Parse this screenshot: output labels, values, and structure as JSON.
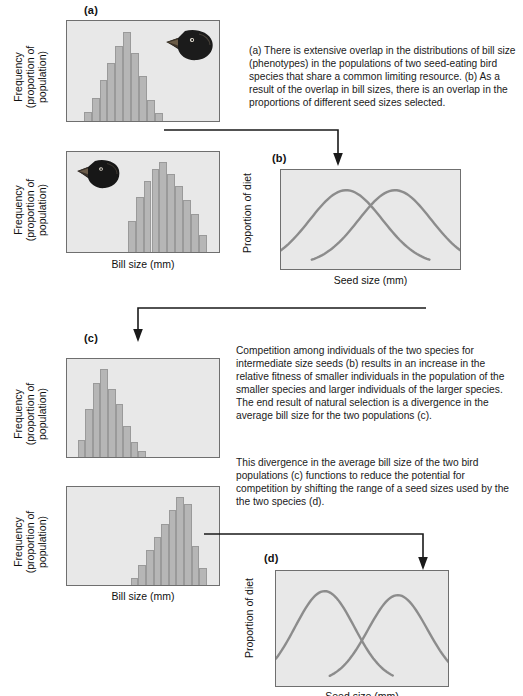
{
  "figure": {
    "bar_color": "#b6b6b6",
    "curve_color": "#8c8c8c",
    "panel_bg": "#e8e8e8",
    "panel_border": "#6f6f6f",
    "arrow_color": "#1a1a1a"
  },
  "panels": {
    "a": {
      "tag": "(a)",
      "ylabel_line1": "Frequency",
      "ylabel_line2": "(proportion of",
      "ylabel_line3": "population)",
      "xlabel": "Bill size (mm)",
      "bird_icon_top": "bird-head-icon",
      "bird_icon_bottom": "bird-head-icon"
    },
    "b": {
      "tag": "(b)",
      "ylabel": "Proportion of diet",
      "xlabel": "Seed size (mm)"
    },
    "c": {
      "tag": "(c)",
      "ylabel_line1": "Frequency",
      "ylabel_line2": "(proportion of",
      "ylabel_line3": "population)",
      "xlabel": "Bill size (mm)"
    },
    "d": {
      "tag": "(d)",
      "ylabel": "Proportion of diet",
      "xlabel": "Seed size (mm)"
    }
  },
  "captions": {
    "first": "(a) There is extensive overlap in the distributions of bill size (phenotypes) in the populations of two seed-eating bird species that share a common limiting resource. (b) As a result of the overlap in bill sizes, there is an overlap in the proportions of different seed sizes selected.",
    "second": "Competition among individuals of the two species for intermediate size seeds (b) results in an increase in the relative fitness of smaller individuals in the population of the smaller species and larger individuals of the larger species. The end result of natural selection is a divergence in the average bill size for the two populations (c).",
    "third": "This divergence in the average bill size of the two bird populations (c) functions to reduce the potential for competition by shifting the range of a seed sizes used by the the two species (d)."
  },
  "chart_data": [
    {
      "id": "a-top",
      "type": "bar",
      "title": "Species 1 bill size distribution (before displacement)",
      "xlabel": "Bill size (mm)",
      "ylabel": "Frequency (proportion of population)",
      "ylim": [
        0,
        100
      ],
      "grid": false,
      "categories": [
        "1",
        "2",
        "3",
        "4",
        "5",
        "6",
        "7",
        "8",
        "9",
        "10"
      ],
      "values": [
        10,
        24,
        44,
        62,
        80,
        95,
        72,
        48,
        22,
        8
      ],
      "bar_start_fraction": 0.11,
      "bar_width_fraction": 0.052
    },
    {
      "id": "a-bottom",
      "type": "bar",
      "title": "Species 2 bill size distribution (before displacement)",
      "xlabel": "Bill size (mm)",
      "ylabel": "Frequency (proportion of population)",
      "ylim": [
        0,
        100
      ],
      "grid": false,
      "categories": [
        "1",
        "2",
        "3",
        "4",
        "5",
        "6",
        "7",
        "8",
        "9",
        "10"
      ],
      "values": [
        33,
        58,
        76,
        88,
        96,
        83,
        70,
        55,
        40,
        18
      ],
      "bar_start_fraction": 0.4,
      "bar_width_fraction": 0.052
    },
    {
      "id": "b",
      "type": "line",
      "title": "Proportion of diet vs seed size (before displacement)",
      "xlabel": "Seed size (mm)",
      "ylabel": "Proportion of diet",
      "grid": false,
      "series": [
        {
          "name": "Species 1 diet",
          "peak_x": 0.36,
          "spread": 0.2,
          "peak_y": 0.88
        },
        {
          "name": "Species 2 diet",
          "peak_x": 0.63,
          "spread": 0.2,
          "peak_y": 0.88
        }
      ],
      "overlap": "extensive"
    },
    {
      "id": "c-top",
      "type": "bar",
      "title": "Species 1 bill size distribution (after displacement, smaller)",
      "xlabel": "Bill size (mm)",
      "ylabel": "Frequency (proportion of population)",
      "ylim": [
        0,
        100
      ],
      "grid": false,
      "categories": [
        "1",
        "2",
        "3",
        "4",
        "5",
        "6",
        "7",
        "8",
        "9"
      ],
      "values": [
        18,
        52,
        80,
        96,
        74,
        58,
        34,
        16,
        6
      ],
      "bar_start_fraction": 0.07,
      "bar_width_fraction": 0.05
    },
    {
      "id": "c-bottom",
      "type": "bar",
      "title": "Species 2 bill size distribution (after displacement, larger)",
      "xlabel": "Bill size (mm)",
      "ylabel": "Frequency (proportion of population)",
      "ylim": [
        0,
        100
      ],
      "grid": false,
      "categories": [
        "1",
        "2",
        "3",
        "4",
        "5",
        "6",
        "7",
        "8",
        "9"
      ],
      "values": [
        8,
        22,
        38,
        52,
        66,
        82,
        96,
        88,
        42,
        18
      ],
      "bar_start_fraction": 0.42,
      "bar_width_fraction": 0.05
    },
    {
      "id": "d",
      "type": "line",
      "title": "Proportion of diet vs seed size (after displacement)",
      "xlabel": "Seed size (mm)",
      "ylabel": "Proportion of diet",
      "grid": false,
      "series": [
        {
          "name": "Species 1 diet",
          "peak_x": 0.28,
          "spread": 0.17,
          "peak_y": 0.9
        },
        {
          "name": "Species 2 diet",
          "peak_x": 0.7,
          "spread": 0.17,
          "peak_y": 0.86
        }
      ],
      "overlap": "reduced"
    }
  ]
}
